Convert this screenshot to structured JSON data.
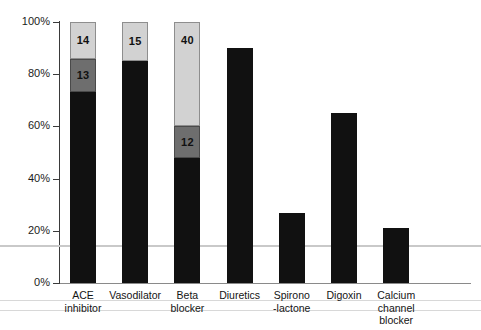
{
  "chart_data": {
    "type": "bar",
    "subtype": "stacked-bar",
    "title": "",
    "subtitle": "",
    "xlabel": "",
    "ylabel": "",
    "ylim": [
      0,
      100
    ],
    "y_tick_labels": [
      "0%",
      "20%",
      "40%",
      "60%",
      "80%",
      "100%"
    ],
    "y_tick_values": [
      0,
      20,
      40,
      60,
      80,
      100
    ],
    "grid": false,
    "legend": "none",
    "legend_entries": [],
    "categories": [
      "ACE\ninhibitor",
      "Vasodilator",
      "Beta\nblocker",
      "Diuretics",
      "Spirono\n-lactone",
      "Digoxin",
      "Calcium\nchannel\nblocker"
    ],
    "series": [
      {
        "name": "dark-segment",
        "color": "#111111",
        "values": [
          73,
          85,
          48,
          90,
          27,
          65,
          21
        ]
      },
      {
        "name": "mid-gray-segment",
        "color": "#6e6e6e",
        "values": [
          13,
          0,
          12,
          0,
          0,
          0,
          0
        ]
      },
      {
        "name": "light-gray-segment",
        "color": "#d2d2d2",
        "values": [
          14,
          15,
          40,
          0,
          0,
          0,
          0
        ]
      }
    ],
    "data_labels": [
      {
        "category": "ACE inhibitor",
        "segment": "mid-gray-segment",
        "text": "13"
      },
      {
        "category": "ACE inhibitor",
        "segment": "light-gray-segment",
        "text": "14"
      },
      {
        "category": "Vasodilator",
        "segment": "light-gray-segment",
        "text": "15"
      },
      {
        "category": "Beta blocker",
        "segment": "mid-gray-segment",
        "text": "12"
      },
      {
        "category": "Beta blocker",
        "segment": "light-gray-segment",
        "text": "40"
      }
    ],
    "reference_line": {
      "value": 14.5,
      "color": "#c9c9c9"
    },
    "colors": {
      "dark": "#111111",
      "mid": "#6e6e6e",
      "light": "#d2d2d2",
      "axis": "#3a3a3a",
      "reference": "#c9c9c9",
      "background": "#ffffff"
    }
  },
  "axis": {
    "ticks": [
      {
        "label": "100%",
        "value": 100
      },
      {
        "label": "80%",
        "value": 80
      },
      {
        "label": "60%",
        "value": 60
      },
      {
        "label": "40%",
        "value": 40
      },
      {
        "label": "20%",
        "value": 20
      },
      {
        "label": "0%",
        "value": 0
      }
    ]
  },
  "bars": [
    {
      "category_label": "ACE\ninhibitor",
      "segments": [
        {
          "kind": "dark",
          "value": 73,
          "label": ""
        },
        {
          "kind": "mid",
          "value": 13,
          "label": "13"
        },
        {
          "kind": "light",
          "value": 14,
          "label": "14"
        }
      ]
    },
    {
      "category_label": "Vasodilator",
      "segments": [
        {
          "kind": "dark",
          "value": 85,
          "label": ""
        },
        {
          "kind": "light",
          "value": 15,
          "label": "15"
        }
      ]
    },
    {
      "category_label": "Beta\nblocker",
      "segments": [
        {
          "kind": "dark",
          "value": 48,
          "label": ""
        },
        {
          "kind": "mid",
          "value": 12,
          "label": "12"
        },
        {
          "kind": "light",
          "value": 40,
          "label": "40"
        }
      ]
    },
    {
      "category_label": "Diuretics",
      "segments": [
        {
          "kind": "dark",
          "value": 90,
          "label": ""
        }
      ]
    },
    {
      "category_label": "Spirono\n-lactone",
      "segments": [
        {
          "kind": "dark",
          "value": 27,
          "label": ""
        }
      ]
    },
    {
      "category_label": "Digoxin",
      "segments": [
        {
          "kind": "dark",
          "value": 65,
          "label": ""
        }
      ]
    },
    {
      "category_label": "Calcium\nchannel\nblocker",
      "segments": [
        {
          "kind": "dark",
          "value": 21,
          "label": ""
        }
      ]
    }
  ]
}
